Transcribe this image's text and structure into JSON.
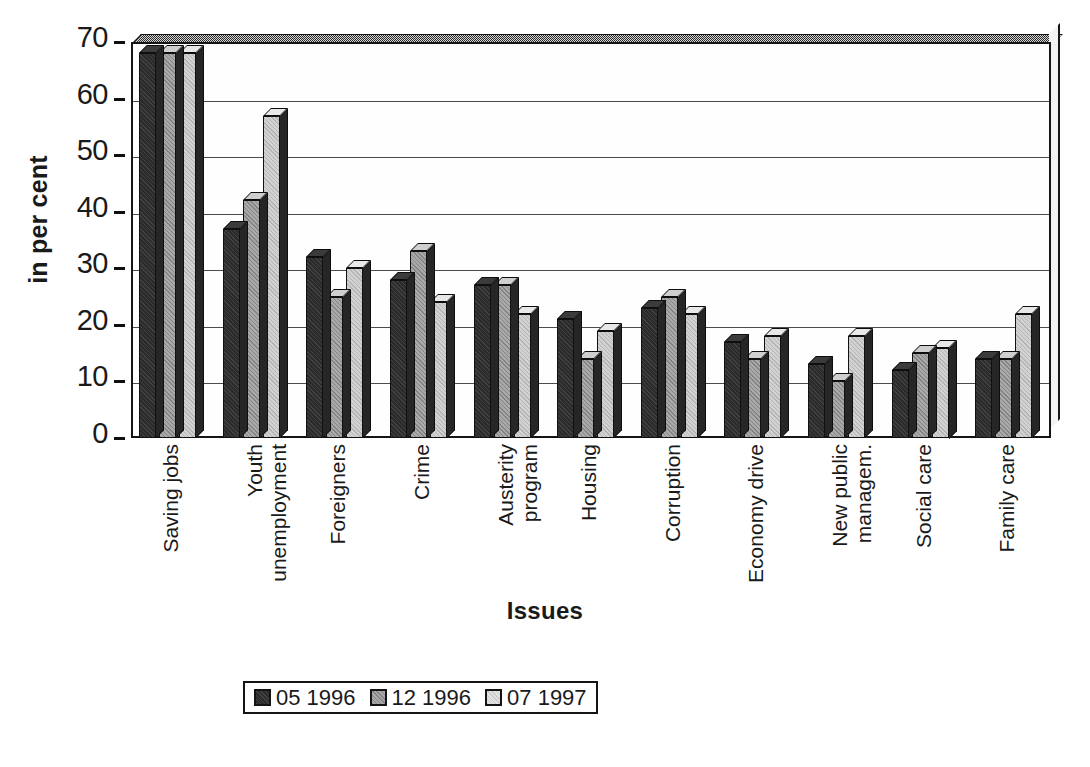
{
  "chart_data": {
    "type": "bar",
    "title": "",
    "xlabel": "Issues",
    "ylabel": "in per cent",
    "ylim": [
      0,
      70
    ],
    "yticks": [
      0,
      10,
      20,
      30,
      40,
      50,
      60,
      70
    ],
    "grid": true,
    "legend_position": "bottom",
    "categories": [
      "Saving jobs",
      "Youth unemployment",
      "Foreigners",
      "Crime",
      "Austerity program",
      "Housing",
      "Corruption",
      "Economy drive",
      "New public managem.",
      "Social care",
      "Family care"
    ],
    "category_lines": [
      [
        "Saving jobs"
      ],
      [
        "Youth",
        "unemployment"
      ],
      [
        "Foreigners"
      ],
      [
        "Crime"
      ],
      [
        "Austerity",
        "program"
      ],
      [
        "Housing"
      ],
      [
        "Corruption"
      ],
      [
        "Economy drive"
      ],
      [
        "New public",
        "managem."
      ],
      [
        "Social care"
      ],
      [
        "Family care"
      ]
    ],
    "series": [
      {
        "name": "05 1996",
        "color": "#2b2b2b",
        "values": [
          68,
          37,
          32,
          28,
          27,
          21,
          23,
          17,
          13,
          12,
          14
        ]
      },
      {
        "name": "12 1996",
        "color": "#a9a9a9",
        "values": [
          68,
          42,
          25,
          33,
          27,
          14,
          25,
          14,
          10,
          15,
          14
        ]
      },
      {
        "name": "07 1997",
        "color": "#d2d2d2",
        "values": [
          68,
          57,
          30,
          24,
          22,
          19,
          22,
          18,
          18,
          16,
          22
        ]
      }
    ]
  },
  "legend": {
    "items": [
      {
        "label": "05 1996"
      },
      {
        "label": "12 1996"
      },
      {
        "label": "07 1997"
      }
    ]
  },
  "axes": {
    "y_title": "in per cent",
    "x_title": "Issues",
    "y_tick_labels": [
      "70",
      "60",
      "50",
      "40",
      "30",
      "20",
      "10",
      "0"
    ]
  }
}
